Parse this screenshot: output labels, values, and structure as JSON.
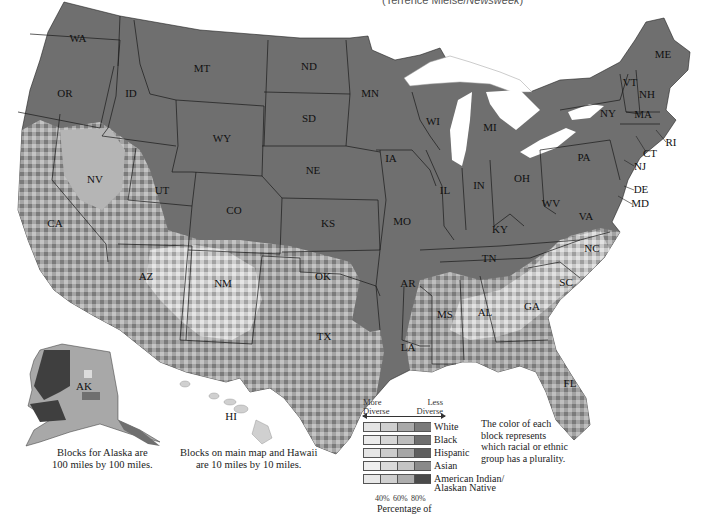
{
  "credit": {
    "prefix": "(Terrence Mielse/",
    "source": "Newsweek",
    "suffix": ")"
  },
  "states": [
    {
      "code": "WA",
      "x": 78,
      "y": 42
    },
    {
      "code": "OR",
      "x": 65,
      "y": 97
    },
    {
      "code": "ID",
      "x": 131,
      "y": 97
    },
    {
      "code": "MT",
      "x": 202,
      "y": 72
    },
    {
      "code": "ND",
      "x": 309,
      "y": 70
    },
    {
      "code": "SD",
      "x": 309,
      "y": 122
    },
    {
      "code": "WY",
      "x": 222,
      "y": 142
    },
    {
      "code": "NE",
      "x": 313,
      "y": 174
    },
    {
      "code": "NV",
      "x": 95,
      "y": 183
    },
    {
      "code": "UT",
      "x": 162,
      "y": 194
    },
    {
      "code": "CO",
      "x": 234,
      "y": 214
    },
    {
      "code": "KS",
      "x": 328,
      "y": 227
    },
    {
      "code": "CA",
      "x": 55,
      "y": 227
    },
    {
      "code": "AZ",
      "x": 146,
      "y": 280
    },
    {
      "code": "NM",
      "x": 223,
      "y": 287
    },
    {
      "code": "OK",
      "x": 323,
      "y": 280
    },
    {
      "code": "TX",
      "x": 324,
      "y": 340
    },
    {
      "code": "MN",
      "x": 370,
      "y": 97
    },
    {
      "code": "WI",
      "x": 433,
      "y": 125
    },
    {
      "code": "MI",
      "x": 490,
      "y": 131
    },
    {
      "code": "IA",
      "x": 391,
      "y": 162
    },
    {
      "code": "IL",
      "x": 445,
      "y": 194
    },
    {
      "code": "IN",
      "x": 479,
      "y": 189
    },
    {
      "code": "OH",
      "x": 522,
      "y": 182
    },
    {
      "code": "PA",
      "x": 584,
      "y": 161
    },
    {
      "code": "NY",
      "x": 608,
      "y": 117
    },
    {
      "code": "ME",
      "x": 663,
      "y": 58
    },
    {
      "code": "VT",
      "x": 630,
      "y": 86
    },
    {
      "code": "NH",
      "x": 647,
      "y": 98
    },
    {
      "code": "MA",
      "x": 643,
      "y": 118
    },
    {
      "code": "MO",
      "x": 402,
      "y": 225
    },
    {
      "code": "KY",
      "x": 500,
      "y": 233
    },
    {
      "code": "WV",
      "x": 551,
      "y": 207
    },
    {
      "code": "VA",
      "x": 586,
      "y": 220
    },
    {
      "code": "TN",
      "x": 489,
      "y": 262
    },
    {
      "code": "NC",
      "x": 592,
      "y": 252
    },
    {
      "code": "AR",
      "x": 408,
      "y": 287
    },
    {
      "code": "SC",
      "x": 566,
      "y": 286
    },
    {
      "code": "MS",
      "x": 445,
      "y": 318
    },
    {
      "code": "AL",
      "x": 485,
      "y": 316
    },
    {
      "code": "GA",
      "x": 532,
      "y": 310
    },
    {
      "code": "LA",
      "x": 408,
      "y": 351
    },
    {
      "code": "FL",
      "x": 570,
      "y": 387
    },
    {
      "code": "AK",
      "x": 84,
      "y": 390
    },
    {
      "code": "HI",
      "x": 231,
      "y": 420
    }
  ],
  "callouts": [
    {
      "code": "RI",
      "x": 671,
      "y": 146
    },
    {
      "code": "CT",
      "x": 650,
      "y": 157
    },
    {
      "code": "NJ",
      "x": 640,
      "y": 170
    },
    {
      "code": "DE",
      "x": 641,
      "y": 193
    },
    {
      "code": "MD",
      "x": 640,
      "y": 207
    }
  ],
  "notes": {
    "alaska": [
      "Blocks for Alaska are",
      "100 miles by 100 miles."
    ],
    "main": [
      "Blocks on main map and Hawaii",
      "are 10 miles by 10 miles."
    ],
    "description": "The color of each block represents which racial or ethnic group has a plurality."
  },
  "legend": {
    "more": [
      "More",
      "Diverse"
    ],
    "less": [
      "Less",
      "Diverse"
    ],
    "rows": [
      {
        "label": "White",
        "colors": [
          "#e4e4e4",
          "#cfcfcf",
          "#a9a9a9",
          "#7a7a7a"
        ]
      },
      {
        "label": "Black",
        "colors": [
          "#ebebeb",
          "#d6d6d6",
          "#bdbdbd",
          "#6e6e6e"
        ]
      },
      {
        "label": "Hispanic",
        "colors": [
          "#e6e6e6",
          "#cccccc",
          "#a6a6a6",
          "#5f5f5f"
        ]
      },
      {
        "label": "Asian",
        "colors": [
          "#efefef",
          "#dadada",
          "#c4c4c4",
          "#8a8a8a"
        ]
      },
      {
        "label": "American Indian/",
        "colors": [
          "#e8e8e8",
          "#d0d0d0",
          "#adadad",
          "#4a4a4a"
        ]
      }
    ],
    "row5_label_line2": "Alaskan Native",
    "ticks": [
      "40%",
      "60%",
      "80%"
    ],
    "axis_label": "Percentage of"
  },
  "colors": {
    "dominant": "#6f6f6f",
    "light": "#b8b8b8",
    "pale": "#dcdcdc",
    "dark": "#3f3f3f",
    "border": "#1a1a1a"
  }
}
